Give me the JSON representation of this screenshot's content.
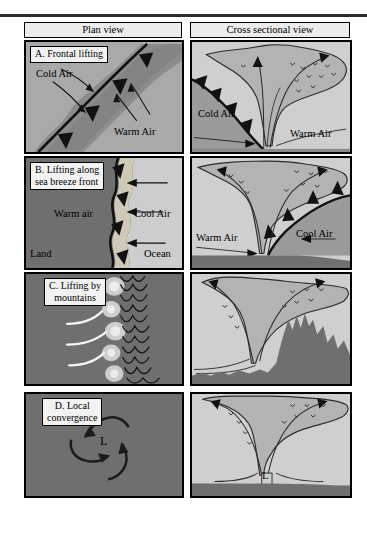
{
  "figure": {
    "column_headers": {
      "left": "Plan view",
      "right": "Cross sectional view"
    },
    "panels": [
      {
        "id": "A",
        "label": "A. Frontal lifting",
        "plan_labels": [
          "Cold Air",
          "Warm Air"
        ],
        "cross_labels": [
          "Cold Air",
          "Warm Air"
        ],
        "feature": "cold front"
      },
      {
        "id": "B",
        "label": "B. Lifting along\nsea breeze front",
        "plan_labels": [
          "Warm air",
          "Cool Air",
          "Land",
          "Ocean"
        ],
        "cross_labels": [
          "Warm Air",
          "Cool Air"
        ],
        "feature": "sea breeze front"
      },
      {
        "id": "C",
        "label": "C. Lifting by\nmountains",
        "plan_labels": [],
        "cross_labels": [],
        "feature": "mountains"
      },
      {
        "id": "D",
        "label": "D. Local\nconvergence",
        "plan_labels": [
          "L"
        ],
        "cross_labels": [
          "L"
        ],
        "feature": "low pressure convergence"
      }
    ]
  },
  "colors": {
    "background": "#ffffff",
    "panel_fill": "#a9a9a9",
    "cloud_band": "#8f8f8f",
    "dark_land": "#6f6f6f",
    "light_sky": "#d0d0d0",
    "cloud": "#b5b5b5",
    "ink": "#000000",
    "label_box": "#f2f2f2",
    "header_box": "#ececec",
    "rule": "#2b2b2b"
  }
}
